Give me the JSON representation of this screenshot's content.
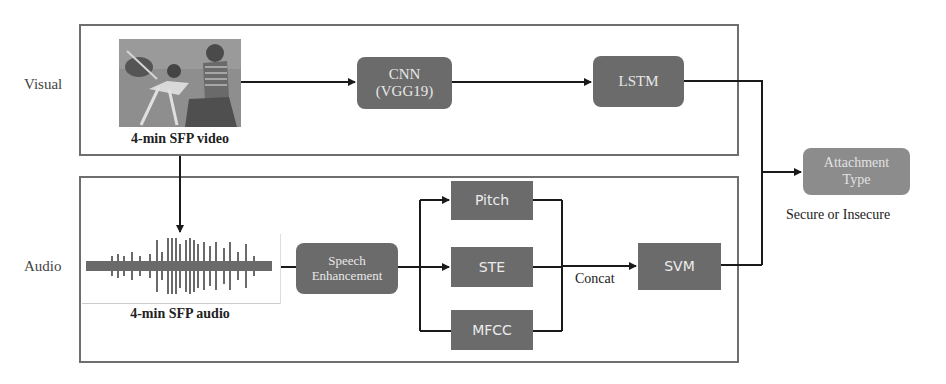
{
  "rows": {
    "visual_label": "Visual",
    "audio_label": "Audio"
  },
  "visual": {
    "input_caption": "4-min SFP video",
    "cnn": {
      "line1": "CNN",
      "line2": "(VGG19)"
    },
    "lstm": "LSTM"
  },
  "audio": {
    "input_caption": "4-min SFP audio",
    "speech_enhancement": {
      "line1": "Speech",
      "line2": "Enhancement"
    },
    "features": [
      "Pitch",
      "STE",
      "MFCC"
    ],
    "concat_label": "Concat",
    "svm": "SVM"
  },
  "output": {
    "box": {
      "line1": "Attachment",
      "line2": "Type"
    },
    "caption": "Secure or Insecure"
  },
  "colors": {
    "box_dark": "#6b6b6b",
    "box_light": "#8c8c8c",
    "frame": "#6e6e6e",
    "line": "#1a1a1a"
  }
}
